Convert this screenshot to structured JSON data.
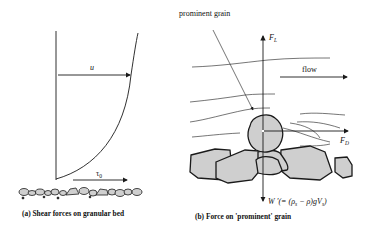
{
  "panel_a": {
    "velocity_label": "u",
    "shear_label": "τ",
    "shear_sub": "0",
    "caption": "(a) Shear forces on granular bed"
  },
  "panel_b": {
    "grain_label": "prominent grain",
    "flow_label": "flow",
    "lift_label": "F",
    "lift_sub": "L",
    "drag_label": "F",
    "drag_sub": "D",
    "weight_label": "W ′(= (ρ",
    "weight_sub1": "s",
    "weight_mid": " − ρ)gV",
    "weight_sub2": "s",
    "weight_end": ")",
    "caption": "(b) Force on 'prominent' grain"
  },
  "colors": {
    "line": "#1a1a1a",
    "grain_fill": "#cfcfcf",
    "background": "#ffffff"
  }
}
